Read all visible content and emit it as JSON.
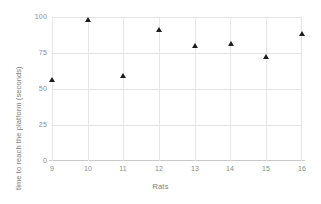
{
  "chart_data": {
    "type": "scatter",
    "title": "",
    "xlabel": "Rats",
    "ylabel": "time to reach the platform (seconds)",
    "x": [
      9,
      10,
      11,
      12,
      13,
      14,
      15,
      16
    ],
    "values": [
      56,
      98,
      59,
      91,
      80,
      81,
      72,
      88
    ],
    "series": [
      {
        "name": "time to reach the platform",
        "points": [
          {
            "x": 9,
            "y": 56
          },
          {
            "x": 10,
            "y": 98
          },
          {
            "x": 11,
            "y": 59
          },
          {
            "x": 12,
            "y": 91
          },
          {
            "x": 13,
            "y": 80
          },
          {
            "x": 14,
            "y": 81
          },
          {
            "x": 15,
            "y": 72
          },
          {
            "x": 16,
            "y": 88
          }
        ],
        "marker": "triangle",
        "color": "#1d1d1d"
      }
    ],
    "xlim": [
      9,
      16
    ],
    "ylim": [
      0,
      100
    ],
    "xticks": [
      "9",
      "10",
      "11",
      "12",
      "13",
      "14",
      "15",
      "16"
    ],
    "yticks": [
      "0",
      "25",
      "50",
      "75",
      "100"
    ],
    "ytick_values": [
      0,
      25,
      50,
      75,
      100
    ],
    "grid": true,
    "legend": "none",
    "gridline_color": "#e3e3e3",
    "axis_text_color": "#8a8a8a",
    "background": "#ffffff"
  }
}
